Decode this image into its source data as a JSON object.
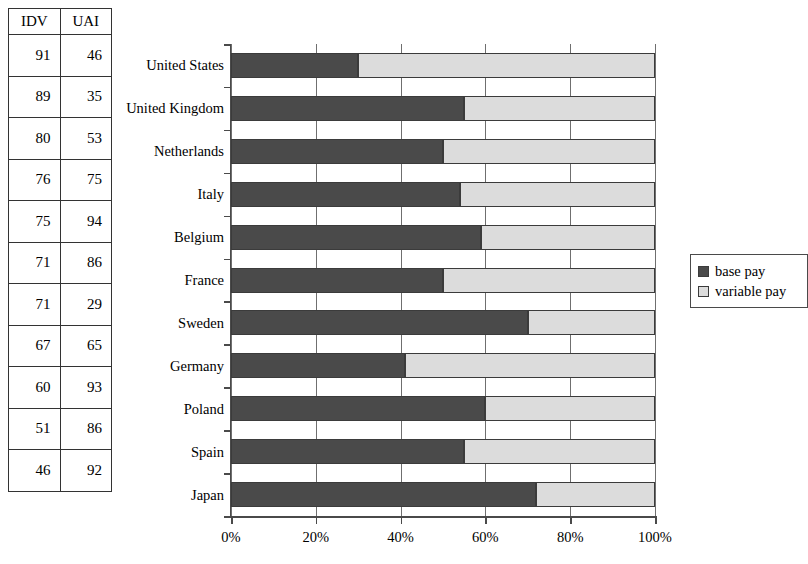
{
  "table": {
    "headers": [
      "IDV",
      "UAI"
    ],
    "rows": [
      {
        "idv": "91",
        "uai": "46"
      },
      {
        "idv": "89",
        "uai": "35"
      },
      {
        "idv": "80",
        "uai": "53"
      },
      {
        "idv": "76",
        "uai": "75"
      },
      {
        "idv": "75",
        "uai": "94"
      },
      {
        "idv": "71",
        "uai": "86"
      },
      {
        "idv": "71",
        "uai": "29"
      },
      {
        "idv": "67",
        "uai": "65"
      },
      {
        "idv": "60",
        "uai": "93"
      },
      {
        "idv": "51",
        "uai": "86"
      },
      {
        "idv": "46",
        "uai": "92"
      }
    ]
  },
  "legend": {
    "items": [
      {
        "label": "base pay",
        "color": "#4a4a4a",
        "swatch": "filled-square-icon"
      },
      {
        "label": "variable pay",
        "color": "#dcdcdc",
        "swatch": "light-square-icon"
      }
    ]
  },
  "chart_data": {
    "type": "bar",
    "orientation": "horizontal",
    "stacked": true,
    "normalized": true,
    "title": "",
    "xlabel": "",
    "ylabel": "",
    "xlim": [
      0,
      100
    ],
    "xticks": [
      0,
      20,
      40,
      60,
      80,
      100
    ],
    "xtick_labels": [
      "0%",
      "20%",
      "40%",
      "60%",
      "80%",
      "100%"
    ],
    "grid": true,
    "legend_position": "right",
    "categories": [
      "United States",
      "United Kingdom",
      "Netherlands",
      "Italy",
      "Belgium",
      "France",
      "Sweden",
      "Germany",
      "Poland",
      "Spain",
      "Japan"
    ],
    "series": [
      {
        "name": "base pay",
        "color": "#4a4a4a",
        "values": [
          30,
          55,
          50,
          54,
          59,
          50,
          70,
          41,
          60,
          55,
          72
        ]
      },
      {
        "name": "variable pay",
        "color": "#dcdcdc",
        "values": [
          70,
          45,
          50,
          46,
          41,
          50,
          30,
          59,
          40,
          45,
          28
        ]
      }
    ]
  }
}
